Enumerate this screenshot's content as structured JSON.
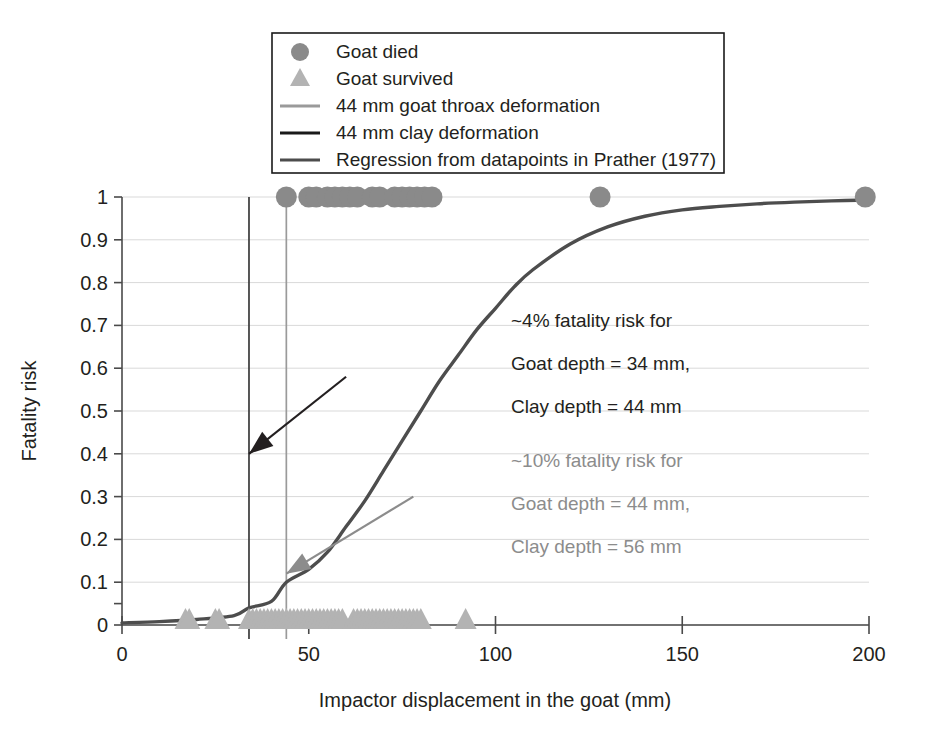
{
  "chart_data": {
    "type": "scatter",
    "title": "",
    "xlabel": "Impactor displacement in the goat (mm)",
    "ylabel": "Fatality risk",
    "xlim": [
      0,
      200
    ],
    "ylim": [
      0,
      1
    ],
    "xticks": [
      "0",
      "50",
      "100",
      "150",
      "200"
    ],
    "xtick_values": [
      0,
      50,
      100,
      150,
      200
    ],
    "yticks": [
      "0",
      "0.1",
      "0.2",
      "0.3",
      "0.4",
      "0.5",
      "0.6",
      "0.7",
      "0.8",
      "0.9",
      "1"
    ],
    "ytick_values": [
      0,
      0.1,
      0.2,
      0.3,
      0.4,
      0.5,
      0.6,
      0.7,
      0.8,
      0.9,
      1
    ],
    "grid": true,
    "legend_position": "top-center",
    "series": [
      {
        "name": "Goat died",
        "type": "scatter",
        "marker": "circle",
        "color": "#8a8a8a",
        "y_constant": 1,
        "x": [
          44,
          50,
          52,
          55,
          57,
          59,
          61,
          63,
          67,
          69,
          73,
          75,
          77,
          79,
          81,
          83,
          128,
          199
        ]
      },
      {
        "name": "Goat survived",
        "type": "scatter",
        "marker": "triangle",
        "color": "#b3b3b3",
        "y_constant": 0,
        "x": [
          17,
          18,
          25,
          26,
          34,
          35,
          36,
          37,
          38,
          39,
          40,
          41,
          42,
          43,
          44,
          45,
          46,
          47,
          48,
          49,
          50,
          51,
          52,
          53,
          54,
          55,
          56,
          57,
          58,
          59,
          62,
          63,
          64,
          65,
          66,
          67,
          68,
          69,
          70,
          71,
          72,
          73,
          74,
          75,
          76,
          77,
          78,
          79,
          80,
          92
        ]
      },
      {
        "name": "Regression from datapoints in Prather (1977)",
        "type": "line",
        "color": "#4d4d4d",
        "model": "logistic",
        "midpoint_x": 92,
        "steepness": 0.052,
        "points": [
          [
            0,
            0.005
          ],
          [
            10,
            0.008
          ],
          [
            20,
            0.013
          ],
          [
            30,
            0.022
          ],
          [
            34,
            0.04
          ],
          [
            40,
            0.055
          ],
          [
            44,
            0.1
          ],
          [
            50,
            0.13
          ],
          [
            55,
            0.17
          ],
          [
            60,
            0.23
          ],
          [
            65,
            0.29
          ],
          [
            70,
            0.36
          ],
          [
            75,
            0.43
          ],
          [
            80,
            0.5
          ],
          [
            85,
            0.57
          ],
          [
            90,
            0.63
          ],
          [
            95,
            0.69
          ],
          [
            100,
            0.74
          ],
          [
            105,
            0.79
          ],
          [
            110,
            0.83
          ],
          [
            120,
            0.89
          ],
          [
            130,
            0.93
          ],
          [
            140,
            0.955
          ],
          [
            150,
            0.97
          ],
          [
            160,
            0.978
          ],
          [
            170,
            0.984
          ],
          [
            180,
            0.988
          ],
          [
            190,
            0.991
          ],
          [
            200,
            0.993
          ]
        ]
      }
    ],
    "reference_lines": [
      {
        "name": "44 mm clay deformation",
        "x": 34,
        "color": "#3b3b3b",
        "y_from": 0,
        "y_to": 1
      },
      {
        "name": "44 mm goat throax deformation",
        "x": 44,
        "color": "#9a9a9a",
        "y_from": 0,
        "y_to": 1
      }
    ],
    "annotations": [
      {
        "id": "dark",
        "color": "#231f20",
        "lines": [
          "~4% fatality risk for",
          "Goat depth = 34 mm,",
          "Clay depth = 44 mm"
        ],
        "arrow_from": [
          60,
          0.58
        ],
        "arrow_to": [
          34,
          0.4
        ]
      },
      {
        "id": "gray",
        "color": "#8c8c8c",
        "lines": [
          "~10% fatality risk for",
          "Goat depth = 44 mm,",
          "Clay depth = 56 mm"
        ],
        "arrow_from": [
          78,
          0.3
        ],
        "arrow_to": [
          44,
          0.12
        ]
      }
    ]
  },
  "legend": {
    "items": [
      {
        "label": "Goat died",
        "marker": "circle",
        "color": "#8a8a8a"
      },
      {
        "label": "Goat survived",
        "marker": "triangle",
        "color": "#b3b3b3"
      },
      {
        "label": "44 mm goat throax deformation",
        "marker": "line",
        "color": "#9a9a9a"
      },
      {
        "label": "44 mm clay deformation",
        "marker": "line",
        "color": "#1a1a1a"
      },
      {
        "label": "Regression from datapoints in Prather (1977)",
        "marker": "line",
        "color": "#4d4d4d"
      }
    ]
  },
  "axes": {
    "x_title": "Impactor displacement in the goat (mm)",
    "y_title": "Fatality risk",
    "x_tick_labels": [
      "0",
      "50",
      "100",
      "150",
      "200"
    ],
    "y_tick_labels": [
      "1",
      "0.9",
      "0.8",
      "0.7",
      "0.6",
      "0.5",
      "0.4",
      "0.3",
      "0.2",
      "0.1",
      "0"
    ]
  },
  "annotation_dark": {
    "line1": "~4% fatality risk for",
    "line2": "Goat depth = 34 mm,",
    "line3": "Clay depth = 44 mm"
  },
  "annotation_gray": {
    "line1": "~10% fatality risk for",
    "line2": "Goat depth = 44 mm,",
    "line3": "Clay depth = 56 mm"
  }
}
